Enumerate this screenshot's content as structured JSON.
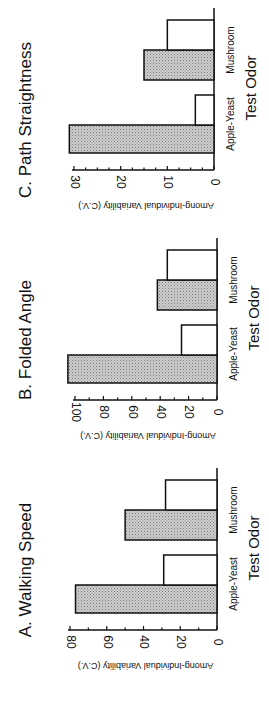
{
  "chart_data": [
    {
      "type": "bar",
      "panel": "A",
      "title": "A. Walking Speed",
      "xlabel": "Test Odor",
      "ylabel": "Among-Individual Variability (C.V.)",
      "categories": [
        "Apple-Yeast",
        "Mushroom"
      ],
      "series": [
        {
          "name": "hatched",
          "values": [
            77,
            50
          ]
        },
        {
          "name": "open",
          "values": [
            29,
            28
          ]
        }
      ],
      "ylim": [
        0,
        80
      ],
      "yticks": [
        0,
        20,
        40,
        60,
        80
      ],
      "minor_tick_step": 10,
      "orientation": "rotated -90°",
      "grid": false
    },
    {
      "type": "bar",
      "panel": "B",
      "title": "B. Folded Angle",
      "xlabel": "Test Odor",
      "ylabel": "Among-Individual Variability (C.V.)",
      "categories": [
        "Apple-Yeast",
        "Mushroom"
      ],
      "series": [
        {
          "name": "hatched",
          "values": [
            105,
            42
          ]
        },
        {
          "name": "open",
          "values": [
            25,
            35
          ]
        }
      ],
      "ylim": [
        0,
        100
      ],
      "yticks": [
        0,
        20,
        40,
        60,
        80,
        100
      ],
      "minor_tick_step": 10,
      "orientation": "rotated -90°",
      "grid": false
    },
    {
      "type": "bar",
      "panel": "C",
      "title": "C. Path Straightness",
      "xlabel": "Test Odor",
      "ylabel": "Among-Individual Variability (C.V.)",
      "categories": [
        "Apple-Yeast",
        "Mushroom"
      ],
      "series": [
        {
          "name": "hatched",
          "values": [
            31,
            15
          ]
        },
        {
          "name": "open",
          "values": [
            4,
            10
          ]
        }
      ],
      "ylim": [
        0,
        30
      ],
      "yticks": [
        0,
        10,
        20,
        30
      ],
      "minor_tick_step": 2.5,
      "orientation": "rotated -90°",
      "grid": false
    }
  ],
  "colors": {
    "hatched_fill": "#c8c8c8",
    "hatched_dot": "#8a8a8a",
    "open_fill": "#ffffff",
    "stroke": "#111111"
  }
}
